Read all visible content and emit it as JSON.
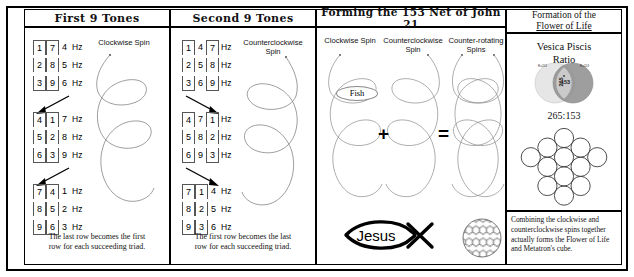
{
  "panels": {
    "left": {
      "title": "First 9 Tones",
      "spin_label": "Clockwise Spin",
      "caption_line1": "The last row becomes the first",
      "caption_line2": "row for each succeeding triad.",
      "triads": [
        {
          "rows": [
            [
              "1",
              "7",
              "4"
            ],
            [
              "2",
              "8",
              "5"
            ],
            [
              "3",
              "9",
              "6"
            ]
          ],
          "unit": "Hz",
          "boxed_cols": [
            1
          ]
        },
        {
          "rows": [
            [
              "4",
              "1",
              "7"
            ],
            [
              "5",
              "2",
              "8"
            ],
            [
              "6",
              "3",
              "9"
            ]
          ],
          "unit": "Hz",
          "boxed_cols": [
            1
          ]
        },
        {
          "rows": [
            [
              "7",
              "4",
              "1"
            ],
            [
              "8",
              "5",
              "2"
            ],
            [
              "9",
              "6",
              "3"
            ]
          ],
          "unit": "Hz",
          "boxed_cols": [
            1
          ]
        }
      ]
    },
    "middle_left": {
      "title": "Second 9 Tones",
      "spin_label": "Counterclockwise Spin",
      "caption_line1": "The first row becomes the last",
      "caption_line2": "row for each succeeding triad.",
      "triads": [
        {
          "rows": [
            [
              "1",
              "4",
              "7"
            ],
            [
              "2",
              "5",
              "8"
            ],
            [
              "3",
              "6",
              "9"
            ]
          ],
          "unit": "Hz",
          "boxed_cols": [
            1
          ]
        },
        {
          "rows": [
            [
              "4",
              "7",
              "1"
            ],
            [
              "5",
              "8",
              "2"
            ],
            [
              "6",
              "9",
              "3"
            ]
          ],
          "unit": "Hz",
          "boxed_cols": [
            1
          ]
        },
        {
          "rows": [
            [
              "7",
              "1",
              "4"
            ],
            [
              "8",
              "2",
              "5"
            ],
            [
              "9",
              "3",
              "6"
            ]
          ],
          "unit": "Hz",
          "boxed_cols": [
            1
          ]
        }
      ]
    },
    "center": {
      "title": "Forming the 153 Net of John 21",
      "col1_label": "Clockwise Spin",
      "col2_label": "Counterclockwise Spin",
      "col3_label": "Counter-rotating Spins",
      "fish_tag": "Fish",
      "plus_symbol": "+",
      "equals_symbol": "=",
      "jesus_label": "Jesus"
    },
    "right": {
      "title_line1": "Formation of the",
      "title_line2": "Flower of Life",
      "vesica_title_line1": "Vesica Piscis",
      "vesica_title_line2": "Ratio",
      "circle_left_value": "265",
      "circle_center_value": "153",
      "circle_left_tag": "R=153",
      "circle_right_tag": "R=153",
      "ratio": "265:153",
      "note": "Combining the clockwise and counterclockwise spins together actually forms the Flower of Life and Metatron's cube."
    }
  },
  "colors": {
    "ink": "#000000",
    "spiral": "#7c7c7c",
    "vesica_left": "#e2e2e2",
    "vesica_right": "#8d8d8d",
    "vesica_overlap": "#cfcfcf"
  }
}
